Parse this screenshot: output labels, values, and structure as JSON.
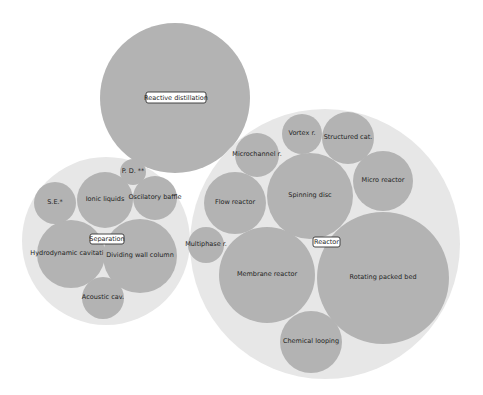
{
  "chart_data": {
    "type": "circle-packing",
    "title": "",
    "colors": {
      "group_fill": "#e7e7e7",
      "leaf_fill": "#b3b3b3",
      "background": "#ffffff",
      "label_box_border": "#333333"
    },
    "groups": [
      {
        "name": "Reactive distillation",
        "cx": 175,
        "cy": 98,
        "r": 75,
        "label_box": {
          "x": 146,
          "y": 92,
          "w": 60,
          "h": 11
        },
        "is_leaf": true,
        "children": []
      },
      {
        "name": "Separation",
        "cx": 106,
        "cy": 241,
        "r": 84,
        "label_box": {
          "x": 90,
          "y": 234,
          "w": 34,
          "h": 10
        },
        "children": [
          {
            "name": "P. D. **",
            "cx": 133,
            "cy": 172,
            "r": 13
          },
          {
            "name": "S.E.*",
            "cx": 55,
            "cy": 203,
            "r": 21
          },
          {
            "name": "Ionic liquids",
            "cx": 105,
            "cy": 200,
            "r": 28
          },
          {
            "name": "Oscilatory baffle",
            "cx": 155,
            "cy": 198,
            "r": 22
          },
          {
            "name": "Hydrodynamic cavitation",
            "cx": 71,
            "cy": 254,
            "r": 34
          },
          {
            "name": "Dividing wall column",
            "cx": 140,
            "cy": 256,
            "r": 37
          },
          {
            "name": "Acoustic cav.",
            "cx": 103,
            "cy": 298,
            "r": 21
          }
        ]
      },
      {
        "name": "Reactor",
        "cx": 325,
        "cy": 244,
        "r": 135,
        "label_box": {
          "x": 313,
          "y": 237,
          "w": 27,
          "h": 10
        },
        "children": [
          {
            "name": "Vortex r.",
            "cx": 302,
            "cy": 134,
            "r": 20
          },
          {
            "name": "Structured cat.",
            "cx": 348,
            "cy": 138,
            "r": 26
          },
          {
            "name": "Microchannel r.",
            "cx": 257,
            "cy": 155,
            "r": 22
          },
          {
            "name": "Spinning disc",
            "cx": 310,
            "cy": 196,
            "r": 43
          },
          {
            "name": "Micro reactor",
            "cx": 383,
            "cy": 181,
            "r": 30
          },
          {
            "name": "Flow reactor",
            "cx": 235,
            "cy": 203,
            "r": 31
          },
          {
            "name": "Multiphase r.",
            "cx": 206,
            "cy": 245,
            "r": 18
          },
          {
            "name": "Membrane reactor",
            "cx": 267,
            "cy": 275,
            "r": 48
          },
          {
            "name": "Rotating packed bed",
            "cx": 383,
            "cy": 278,
            "r": 66
          },
          {
            "name": "Chemical looping",
            "cx": 311,
            "cy": 342,
            "r": 31
          }
        ]
      }
    ],
    "legend": null,
    "axes": null
  }
}
